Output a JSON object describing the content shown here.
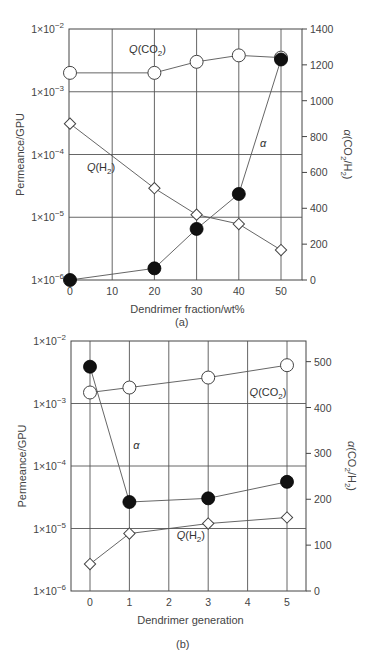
{
  "chart_data": [
    {
      "panel_label": "(a)",
      "type": "line",
      "title": "",
      "xlabel": "Dendrimer fraction/wt%",
      "ylabel": "Permeance/GPU",
      "ylabel_right": "α(CO2/H2)",
      "x_ticks": [
        0,
        10,
        20,
        30,
        40,
        50
      ],
      "xlim": [
        0,
        55
      ],
      "y_scale": "log",
      "ylim": [
        1e-06,
        0.01
      ],
      "y_tick_labels": [
        "1×10−2",
        "1×10−3",
        "1×10−4",
        "1×10−5",
        "1×10−6"
      ],
      "y_right_ticks": [
        0,
        200,
        400,
        600,
        800,
        1000,
        1200,
        1400
      ],
      "y_right_lim": [
        0,
        1400
      ],
      "grid": true,
      "series": [
        {
          "name": "Q(CO2)",
          "axis": "left",
          "marker": "open-circle",
          "x": [
            0,
            20,
            30,
            40,
            50
          ],
          "values": [
            0.002,
            0.002,
            0.003,
            0.0038,
            0.0035
          ]
        },
        {
          "name": "Q(H2)",
          "axis": "left",
          "marker": "open-diamond",
          "x": [
            0,
            20,
            30,
            40,
            50
          ],
          "values": [
            0.00031,
            2.9e-05,
            1.1e-05,
            7.8e-06,
            3e-06
          ]
        },
        {
          "name": "α",
          "axis": "right",
          "marker": "filled-circle",
          "x": [
            0,
            20,
            30,
            40,
            50
          ],
          "values": [
            0,
            65,
            285,
            480,
            1230
          ]
        }
      ],
      "annotations": [
        {
          "text_main": "Q",
          "text_rest": "(CO",
          "sub": "2",
          "close": ")",
          "x": 14,
          "yval": 0.0042
        },
        {
          "text_main": "Q",
          "text_rest": "(H",
          "sub": "2",
          "close": ")",
          "x": 4,
          "yval": 5.5e-05
        },
        {
          "text_main": "α",
          "x": 45,
          "yval_right": 740
        }
      ]
    },
    {
      "panel_label": "(b)",
      "type": "line",
      "title": "",
      "xlabel": "Dendrimer generation",
      "ylabel": "Permeance/GPU",
      "ylabel_right": "α(CO2/H2)",
      "x_ticks": [
        0,
        1,
        2,
        3,
        4,
        5
      ],
      "xlim": [
        -0.5,
        5.5
      ],
      "y_scale": "log",
      "ylim": [
        1e-06,
        0.01
      ],
      "y_tick_labels": [
        "1×10−2",
        "1×10−3",
        "1×10−4",
        "1×10−5",
        "1×10−6"
      ],
      "y_right_ticks": [
        0,
        100,
        200,
        300,
        400,
        500
      ],
      "y_right_lim": [
        0,
        545
      ],
      "grid": true,
      "series": [
        {
          "name": "Q(CO2)",
          "axis": "left",
          "marker": "open-circle",
          "x": [
            0,
            1,
            3,
            5
          ],
          "values": [
            0.0015,
            0.0018,
            0.0026,
            0.0041
          ]
        },
        {
          "name": "Q(H2)",
          "axis": "left",
          "marker": "open-diamond",
          "x": [
            0,
            1,
            3,
            5
          ],
          "values": [
            2.7e-06,
            8.3e-06,
            1.2e-05,
            1.5e-05
          ]
        },
        {
          "name": "α",
          "axis": "right",
          "marker": "filled-circle",
          "x": [
            0,
            1,
            3,
            5
          ],
          "values": [
            489,
            194,
            202,
            238
          ]
        }
      ],
      "annotations": [
        {
          "text_main": "Q",
          "text_rest": "(CO",
          "sub": "2",
          "close": ")",
          "x": 4.05,
          "yval": 0.0013
        },
        {
          "text_main": "Q",
          "text_rest": "(H",
          "sub": "2",
          "close": ")",
          "x": 2.2,
          "yval": 6.8e-06
        },
        {
          "text_main": "α",
          "x": 1.1,
          "yval_right": 310
        }
      ]
    }
  ],
  "panels": {
    "a": {
      "caption": "(a)",
      "xlabel": "Dendrimer fraction/wt%",
      "ylabel": "Permeance/GPU"
    },
    "b": {
      "caption": "(b)",
      "xlabel": "Dendrimer generation",
      "ylabel": "Permeance/GPU"
    }
  },
  "colors": {
    "line": "#555555",
    "frame": "#444444",
    "marker_fill": "#111111",
    "background": "#ffffff"
  }
}
